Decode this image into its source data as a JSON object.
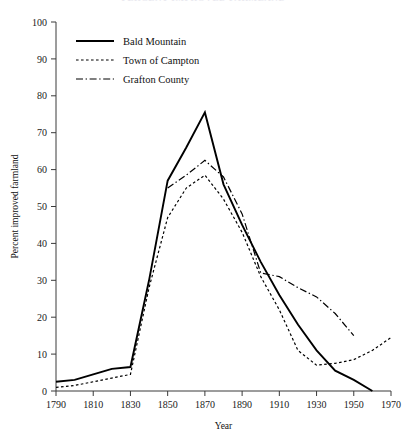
{
  "chart_data": {
    "type": "line",
    "title": "PERCENT IMPROVED FARMLAND",
    "xlabel": "Year",
    "ylabel": "Percent improved farmland",
    "xlim": [
      1790,
      1970
    ],
    "ylim": [
      0,
      100
    ],
    "grid": false,
    "legend_position": "upper-left-inside",
    "x_ticks": [
      1790,
      1810,
      1830,
      1850,
      1870,
      1890,
      1910,
      1930,
      1950,
      1970
    ],
    "y_ticks": [
      0,
      10,
      20,
      30,
      40,
      50,
      60,
      70,
      80,
      90,
      100
    ],
    "series": [
      {
        "name": "Bald Mountain",
        "style": "solid",
        "x": [
          1790,
          1800,
          1810,
          1820,
          1830,
          1840,
          1850,
          1860,
          1870,
          1880,
          1890,
          1900,
          1910,
          1920,
          1930,
          1940,
          1950,
          1960
        ],
        "values": [
          2.5,
          3.0,
          4.5,
          6.0,
          6.5,
          30.0,
          57.0,
          66.0,
          75.5,
          56.0,
          45.0,
          35.0,
          26.0,
          18.0,
          11.0,
          5.5,
          3.0,
          0.0
        ]
      },
      {
        "name": "Town of Campton",
        "style": "dotted",
        "x": [
          1790,
          1800,
          1810,
          1820,
          1830,
          1840,
          1850,
          1860,
          1870,
          1880,
          1890,
          1900,
          1910,
          1920,
          1930,
          1940,
          1950,
          1960,
          1970
        ],
        "values": [
          1.0,
          1.5,
          2.5,
          3.5,
          4.5,
          28.0,
          47.0,
          55.0,
          58.5,
          52.0,
          43.0,
          31.0,
          22.0,
          11.0,
          7.0,
          7.5,
          8.5,
          11.0,
          14.5
        ]
      },
      {
        "name": "Grafton County",
        "style": "dash-dot",
        "x": [
          1850,
          1860,
          1870,
          1880,
          1890,
          1900,
          1910,
          1920,
          1930,
          1940,
          1950
        ],
        "values": [
          55.0,
          58.5,
          62.5,
          58.0,
          48.0,
          32.0,
          31.0,
          28.0,
          25.5,
          21.0,
          15.0
        ]
      }
    ]
  },
  "legend": {
    "items": [
      {
        "label": "Bald Mountain",
        "style": "solid"
      },
      {
        "label": "Town of Campton",
        "style": "dotted"
      },
      {
        "label": "Grafton County",
        "style": "dash-dot"
      }
    ]
  },
  "colors": {
    "ink": "#000000",
    "axis": "#3a3a3a",
    "background": "#ffffff"
  }
}
